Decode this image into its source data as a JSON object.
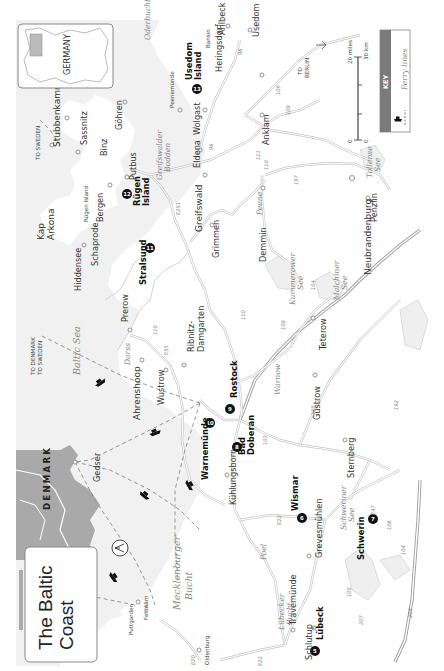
{
  "title": {
    "line1": "The Baltic",
    "line2": "Coast"
  },
  "inset": {
    "country_label": "GERMANY"
  },
  "key": {
    "header": "KEY",
    "items": [
      {
        "symbol": "ferry-boat-dashed-line",
        "label": "Ferry lines"
      }
    ]
  },
  "scale": {
    "miles_zero": "0",
    "miles_max": "20 miles",
    "km_zero": "0",
    "km_max": "30 km"
  },
  "compass": {
    "label": "N"
  },
  "directions": {
    "to_sweden_top": "TO SWEDEN",
    "to_berlin_line1": "TO",
    "to_berlin_line2": "BERLIN",
    "to_denmark": "TO DENMARK",
    "to_sweden": "TO SWEDEN"
  },
  "countries": {
    "denmark": "DENMARK"
  },
  "water_labels": {
    "baltic_sea": "Baltic Sea",
    "mecklenburger_bucht_1": "Mecklenburger",
    "mecklenburger_bucht_2": "Bucht",
    "lubecker_bucht_1": "Lübecker",
    "lubecker_bucht_2": "Bucht",
    "oderbucht": "Oderbucht",
    "greifswalder_bodden_1": "Greifswalder",
    "greifswalder_bodden_2": "Bodden",
    "kummerower_see_1": "Kummerower",
    "kummerower_see_2": "See",
    "malchiner_see_1": "Malchiner",
    "malchiner_see_2": "See",
    "tollense_see_1": "Tollense",
    "tollense_see_2": "See",
    "schweriner_see_1": "Schweriner",
    "schweriner_see_2": "See",
    "peene": "Peene",
    "warnow": "Warnow"
  },
  "numbered_sights": [
    {
      "num": "5",
      "name": "Lübeck"
    },
    {
      "num": "6",
      "name": "Wismar"
    },
    {
      "num": "7",
      "name": "Schwerin"
    },
    {
      "num": "8",
      "name_line1": "Bad",
      "name_line2": "Doberan"
    },
    {
      "num": "9",
      "name": "Rostock"
    },
    {
      "num": "10",
      "name": "Warnemünde"
    },
    {
      "num": "11",
      "name": "Stralsund"
    },
    {
      "num": "12",
      "name_line1": "Rügen",
      "name_line2": "Island"
    },
    {
      "num": "13",
      "name_line1": "Usedom",
      "name_line2": "Island"
    }
  ],
  "towns": {
    "kap_arkona_1": "Kap",
    "kap_arkona_2": "Arkona",
    "stubbenkammer": "Stubbenkammer",
    "sassnitz": "Sassnitz",
    "gohren": "Göhren",
    "binz": "Binz",
    "putbus": "Putbus",
    "bergen": "Bergen",
    "rugen_island_small": "Rügen Island",
    "hiddensee": "Hiddensee",
    "schaprode": "Schaprode",
    "greifswald": "Greifswald",
    "eldena": "Eldena",
    "wolgast": "Wolgast",
    "peenemunde": "Peenemünde",
    "bansin": "Bansin",
    "heringsdorf": "Heringsdorf",
    "ahlbeck": "Ahlbeck",
    "usedom": "Usedom",
    "anklam": "Anklam",
    "grimmen": "Grimmen",
    "demmin": "Demmin",
    "neubrandenburg": "Neubrandenburg",
    "penzlin": "Penzlin",
    "prerow": "Prerow",
    "darss": "Darss",
    "ahrenshoop": "Ahrenshoop",
    "wustrow": "Wustrow",
    "ribnitz_1": "Ribnitz-",
    "ribnitz_2": "Damgarten",
    "teterow": "Teterow",
    "gustrow": "Güstrow",
    "sternberg": "Sternberg",
    "kuhlungsborn": "Kühlungsborn",
    "poel": "Poel",
    "grevesmuhlen": "Grevesmühlen",
    "travemunde": "Travemünde",
    "schlutup": "Schlutup",
    "gedser": "Gedser",
    "fehmarn": "Fehmarn",
    "puttgarden": "Puttgarden",
    "oldenburg": "Oldenburg"
  },
  "road_numbers": {
    "r1": "96",
    "r2": "E251",
    "r3": "96",
    "r4": "109",
    "r5": "111",
    "r6": "109",
    "r7": "110",
    "r8": "197",
    "r9": "E251",
    "r10": "96",
    "r11": "194",
    "r12": "110",
    "r13": "105",
    "r14": "E55",
    "r15": "110",
    "r16": "108",
    "r17": "104",
    "r18": "E55",
    "r19": "192",
    "r20": "103",
    "r21": "105",
    "r22": "208",
    "r23": "104",
    "r24": "106",
    "r25": "E22",
    "r26": "E47",
    "r27": "207",
    "r28": "105",
    "r29": "75",
    "r30": "E22",
    "r31": "E20",
    "r32": "208",
    "r33": "E47"
  }
}
